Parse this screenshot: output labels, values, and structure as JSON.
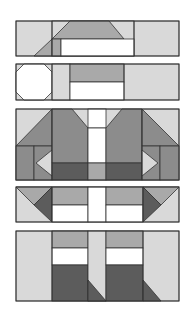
{
  "colors": {
    "white": "#ffffff",
    "light": "#d9d9d9",
    "mid": "#a9a9a9",
    "medium_dark": "#8c8c8c",
    "dark": "#5c5c5c",
    "stroke": "#333333"
  },
  "blocks": [
    {
      "name": "block-1-top-row",
      "y": 21,
      "height": 35
    },
    {
      "name": "block-2-octagon-row",
      "y": 64,
      "height": 36
    },
    {
      "name": "block-3-shirt-row",
      "y": 109,
      "height": 71
    },
    {
      "name": "block-4-triangle-row",
      "y": 187,
      "height": 35
    },
    {
      "name": "block-5-legs-row",
      "y": 231,
      "height": 70
    }
  ]
}
